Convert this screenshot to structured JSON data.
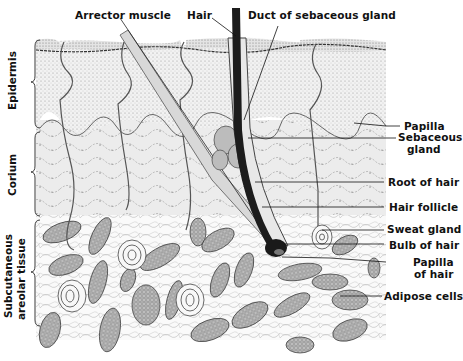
{
  "figure": {
    "top_labels": {
      "arrector_muscle": "Arrector muscle",
      "hair": "Hair",
      "duct": "Duct of sebaceous gland"
    },
    "right_labels": {
      "papilla": "Papilla",
      "sebaceous_1": "Sebaceous",
      "sebaceous_2": "gland",
      "root": "Root of hair",
      "follicle": "Hair follicle",
      "sweat": "Sweat gland",
      "bulb": "Bulb of hair",
      "papilla_hair_1": "Papilla",
      "papilla_hair_2": "of hair",
      "adipose": "Adipose cells"
    },
    "layer_labels": {
      "epidermis": "Epidermis",
      "corium": "Corium",
      "subcutaneous_1": "Subcutaneous",
      "subcutaneous_2": "areolar tissue"
    }
  }
}
